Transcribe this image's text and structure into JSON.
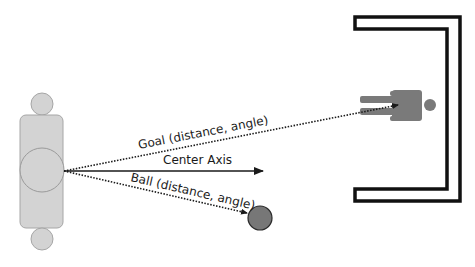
{
  "diagram": {
    "type": "robot-soccer-perception-geometry",
    "colors": {
      "background": "#ffffff",
      "robot_fill": "#d3d3d3",
      "robot_stroke": "#a6a6a6",
      "line": "#1a1a1a",
      "ball_fill": "#777777",
      "ball_stroke": "#2a2a2a",
      "goal_frame": "#111111",
      "goalkeeper_fill": "#7a7a7a"
    },
    "robot": {
      "label": "Robot (top view)",
      "head_top": {
        "cx": 42,
        "cy": 104,
        "r": 11
      },
      "body": {
        "x": 20,
        "y": 115,
        "w": 43,
        "h": 113,
        "rx": 6
      },
      "core": {
        "cx": 42,
        "cy": 170,
        "r": 22
      },
      "head_bottom": {
        "cx": 42,
        "cy": 239,
        "r": 11
      }
    },
    "origin": {
      "x": 64,
      "y": 171
    },
    "vectors": [
      {
        "name": "goal",
        "label": "Goal (distance, angle)",
        "style": "dotted",
        "to": {
          "x": 398,
          "y": 105
        }
      },
      {
        "name": "center-axis",
        "label": "Center Axis",
        "style": "solid",
        "to": {
          "x": 263,
          "y": 171
        }
      },
      {
        "name": "ball",
        "label": "Ball (distance, angle)",
        "style": "dotted",
        "to": {
          "x": 247,
          "y": 213
        }
      }
    ],
    "labels": {
      "goal": "Goal (distance, angle)",
      "center_axis": "Center Axis",
      "ball": "Ball (distance, angle)"
    },
    "ball": {
      "cx": 260,
      "cy": 218,
      "r": 12
    },
    "goal": {
      "outer": {
        "left": 355,
        "top": 17,
        "right": 460,
        "bottom": 201
      },
      "thickness": 14
    }
  }
}
